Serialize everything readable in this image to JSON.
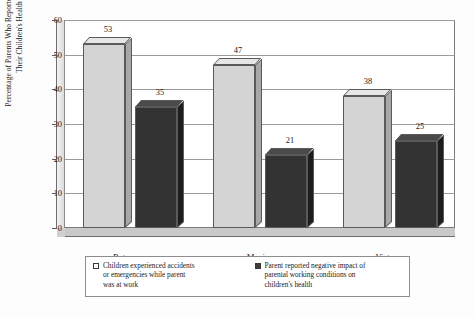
{
  "chart_data": {
    "type": "bar",
    "title": "",
    "xlabel": "",
    "ylabel_line1": "Percentage of Parents Who Reported Risks to",
    "ylabel_line2": "Their Children's Health",
    "categories": [
      "Botswana",
      "Mexico",
      "Vietnam"
    ],
    "series": [
      {
        "name": "Children experienced accidents or emergencies while parent was at work",
        "legend_lines": [
          "Children experienced accidents",
          "or emergencies while parent",
          "was at work"
        ],
        "color": "#d4d4d4",
        "swatch": "open",
        "values": [
          53,
          47,
          38
        ]
      },
      {
        "name": "Parent reported negative impact of parental working conditions on children's health",
        "legend_lines": [
          "Parent reported negative impact of",
          "parental working conditions on",
          "children's health"
        ],
        "color": "#333333",
        "swatch": "solid",
        "values": [
          35,
          21,
          25
        ]
      }
    ],
    "ylim": [
      0,
      60
    ],
    "yticks": [
      0,
      10,
      20,
      30,
      40,
      50,
      60
    ],
    "ytick_labels": [
      "0",
      "10",
      "20",
      "30",
      "40",
      "50",
      "60"
    ],
    "grid": true,
    "legend_position": "bottom",
    "style": "3d-grouped-bar"
  }
}
